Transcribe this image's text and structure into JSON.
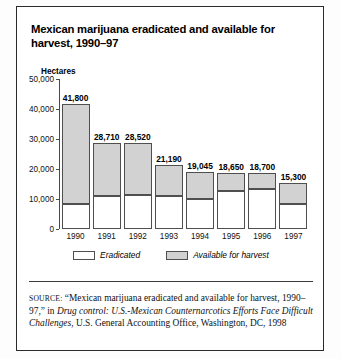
{
  "figure": {
    "title": "Mexican marijuana eradicated and available for harvest, 1990–97",
    "y_axis_label": "Hectares"
  },
  "legend": {
    "items": [
      {
        "label": "Eradicated",
        "color": "#ffffff"
      },
      {
        "label": "Available for harvest",
        "color": "#d2d2d2"
      }
    ]
  },
  "source": {
    "prefix": "SOURCE:",
    "part1": " “Mexican marijuana eradicated and available for harvest, 1990–97,” in ",
    "italic_title": "Drug control: U.S.-Mexican Counternarcotics Efforts Face Difficult Challenges",
    "part2": ", U.S. General Accounting Office, Washington, DC, 1998"
  },
  "chart_data": {
    "type": "bar",
    "title": "Mexican marijuana eradicated and available for harvest, 1990–97",
    "xlabel": "",
    "ylabel": "Hectares",
    "ylim": [
      0,
      50000
    ],
    "yticks": [
      "0",
      "10,000",
      "20,000",
      "30,000",
      "40,000",
      "50,000"
    ],
    "ytick_values": [
      0,
      10000,
      20000,
      30000,
      40000,
      50000
    ],
    "grid": false,
    "stacked": true,
    "legend_position": "bottom",
    "categories": [
      "1990",
      "1991",
      "1992",
      "1993",
      "1994",
      "1995",
      "1996",
      "1997"
    ],
    "totals": [
      41800,
      28710,
      28520,
      21190,
      19045,
      18650,
      18700,
      15300
    ],
    "total_labels": [
      "41,800",
      "28,710",
      "28,520",
      "21,190",
      "19,045",
      "18,650",
      "18,700",
      "15,300"
    ],
    "series": [
      {
        "name": "Eradicated",
        "color": "#ffffff",
        "values": [
          8300,
          11100,
          11400,
          11100,
          10100,
          12800,
          13200,
          8300
        ]
      },
      {
        "name": "Available for harvest",
        "color": "#d2d2d2",
        "values": [
          33500,
          17610,
          17120,
          10090,
          8945,
          5850,
          5500,
          7000
        ]
      }
    ]
  }
}
